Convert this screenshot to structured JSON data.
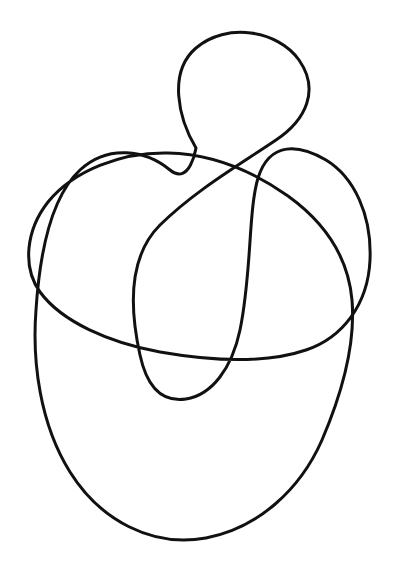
{
  "page": {
    "width": 408,
    "height": 574,
    "background_color": "#ffffff"
  },
  "header": {
    "clipped_text": "Figure 13.  a     b",
    "color": "#b9b9c2"
  },
  "drawing": {
    "name": "single-continuous-closed-curve",
    "description": "Hand-drawn closed loop with multiple self-intersections",
    "stroke_color": "#111111",
    "stroke_width": 3,
    "fill": "none",
    "crossings_count": 6,
    "loop_count": 4,
    "crossings": [
      {
        "label": "top-center",
        "x": 196,
        "y": 148
      },
      {
        "label": "upper-center",
        "x": 182,
        "y": 157
      },
      {
        "label": "left-mid",
        "x": 45,
        "y": 278
      },
      {
        "label": "center-low",
        "x": 147,
        "y": 355
      },
      {
        "label": "right-mid",
        "x": 325,
        "y": 343
      },
      {
        "label": "center-right",
        "x": 245,
        "y": 352
      }
    ],
    "extents": {
      "min_x": 27,
      "max_x": 372,
      "min_y": 35,
      "max_y": 540
    },
    "path_d": "M 196 148 C 178 118 168 72 196 48 C 226 22 278 30 299 60 C 320 90 306 120 276 140 C 236 167 196 190 160 225 C 128 257 130 310 140 355 C 148 392 166 402 186 399 C 212 395 232 368 240 330 C 252 272 248 212 258 178 C 270 140 300 145 326 160 C 354 177 372 215 370 260 C 368 305 342 338 306 350 C 262 365 206 360 160 352 C 110 343 62 322 40 292 C 22 267 26 230 48 202 C 74 170 122 152 168 153 C 212 154 250 169 288 196 C 324 222 348 255 352 300 C 356 348 340 398 322 440 C 300 490 258 528 206 538 C 152 548 100 520 70 472 C 40 424 32 362 36 310 C 40 248 52 196 80 170 C 108 144 146 150 170 170 C 190 186 196 148 196 148 Z"
  }
}
